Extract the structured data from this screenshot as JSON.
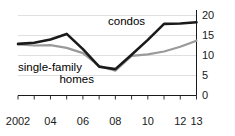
{
  "chart_data": {
    "type": "line",
    "title": "",
    "subtitle": "",
    "xlabel": "",
    "ylabel": "",
    "x": [
      2002,
      2003,
      2004,
      2005,
      2006,
      2007,
      2008,
      2009,
      2010,
      2011,
      2012,
      2013
    ],
    "xtick_labels": [
      "2002",
      "04",
      "06",
      "08",
      "10",
      "12",
      "13"
    ],
    "xtick_values": [
      2002,
      2004,
      2006,
      2008,
      2010,
      2012,
      2013
    ],
    "ytick_labels": [
      "0",
      "5",
      "10",
      "15",
      "20"
    ],
    "ytick_values": [
      0,
      5,
      10,
      15,
      20
    ],
    "xlim": [
      2002,
      2013
    ],
    "ylim": [
      0,
      20
    ],
    "grid": "horizontal",
    "y_axis_position": "right",
    "legend_position": "inline-annotations",
    "series": [
      {
        "name": "condos",
        "color": "#1a1a1a",
        "width": 2.6,
        "values": [
          12.9,
          13.2,
          14.0,
          15.4,
          11.6,
          7.2,
          6.6,
          10.2,
          13.9,
          17.9,
          18.0,
          18.3
        ]
      },
      {
        "name": "single-family homes",
        "color": "#9a9a9a",
        "width": 2.2,
        "values": [
          12.8,
          12.5,
          12.6,
          11.9,
          10.6,
          7.4,
          6.2,
          9.9,
          10.3,
          11.0,
          12.2,
          13.7
        ]
      }
    ],
    "annotations": [
      {
        "text": "condos",
        "series": "condos"
      },
      {
        "text_line1": "single-family",
        "text_line2": "homes",
        "series": "single-family homes"
      }
    ]
  }
}
